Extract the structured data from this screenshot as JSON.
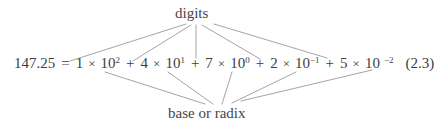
{
  "figure": {
    "caption_number": "(2.3)",
    "equation": {
      "left_hand_side": "147.25",
      "equals_sign": "=",
      "terms": [
        {
          "coefficient": "1",
          "times": "×",
          "base": "10",
          "exponent": "2",
          "plus": "+"
        },
        {
          "coefficient": "4",
          "times": "×",
          "base": "10",
          "exponent": "1",
          "plus": "+"
        },
        {
          "coefficient": "7",
          "times": "×",
          "base": "10",
          "exponent": "0",
          "plus": "+"
        },
        {
          "coefficient": "2",
          "times": "×",
          "base": "10",
          "exponent": "−1",
          "plus": "+"
        },
        {
          "coefficient": "5",
          "times": "×",
          "base": "10",
          "exponent": "−2",
          "plus": ""
        }
      ]
    },
    "annotations": {
      "top_label": "digits",
      "bottom_label": "base or radix"
    },
    "colors": {
      "background": "#ffffff",
      "text": "#3d3d3d",
      "label_text": "#454545",
      "connector_line": "#8d8d8d"
    },
    "connectors": {
      "digits_anchor": {
        "x": 196,
        "y": 24
      },
      "base_anchor": {
        "x": 222,
        "y": 104
      },
      "digit_targets": [
        {
          "x": 70,
          "y": 60
        },
        {
          "x": 133,
          "y": 60
        },
        {
          "x": 196,
          "y": 60
        },
        {
          "x": 260,
          "y": 60
        },
        {
          "x": 327,
          "y": 60
        }
      ],
      "base_targets": [
        {
          "x": 105,
          "y": 72
        },
        {
          "x": 168,
          "y": 72
        },
        {
          "x": 232,
          "y": 72
        },
        {
          "x": 296,
          "y": 72
        },
        {
          "x": 372,
          "y": 70
        }
      ]
    }
  }
}
